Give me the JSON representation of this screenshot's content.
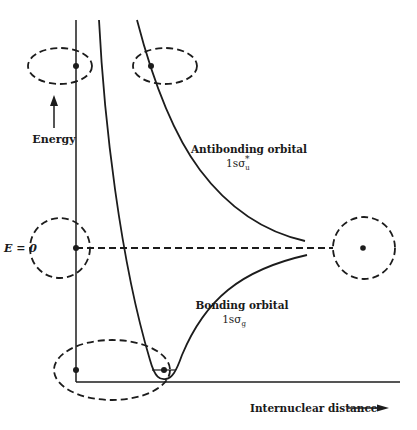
{
  "diagram": {
    "type": "molecular-orbital-energy-curve",
    "labels": {
      "y_axis": "Energy",
      "x_axis": "Internuclear distance",
      "zero_level": "E = 0",
      "antibonding_title": "Antibonding orbital",
      "antibonding_symbol": "1sσ",
      "antibonding_sub": "u",
      "antibonding_sup": "*",
      "bonding_title": "Bonding orbital",
      "bonding_symbol": "1sσ",
      "bonding_sub": "g"
    },
    "curves": [
      {
        "name": "antibonding",
        "description": "Repulsive curve decreasing from high energy toward E=0 at large distance"
      },
      {
        "name": "bonding",
        "description": "Potential well with minimum below E=0, approaching E=0 at large distance"
      },
      {
        "name": "nuclear-repulsion",
        "description": "Steep curve near the energy axis"
      }
    ],
    "orbital_shapes": [
      {
        "name": "united-atom-top-left",
        "shape": "ellipse",
        "nuclei": 1
      },
      {
        "name": "antibonding-top",
        "shape": "ellipse",
        "nuclei": 1
      },
      {
        "name": "separated-atom-left",
        "shape": "circle",
        "nuclei": 1
      },
      {
        "name": "separated-atom-right",
        "shape": "circle",
        "nuclei": 1
      },
      {
        "name": "bonding-minimum",
        "shape": "ellipse",
        "nuclei": 2
      }
    ],
    "colors": {
      "ink": "#1c1c1c",
      "background": "#ffffff"
    }
  }
}
